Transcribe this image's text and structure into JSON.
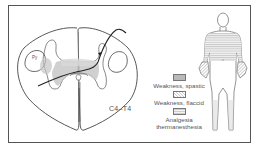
{
  "figure": {
    "segment_label": "C4–T4",
    "tract_label": "Py",
    "legend": [
      {
        "key": "spastic",
        "label": "Weakness, spastic",
        "pattern": "solid-gray"
      },
      {
        "key": "flaccid",
        "label": "Weakness, flaccid",
        "pattern": "diagonal-hatch"
      },
      {
        "key": "analgesia",
        "label_line1": "Analgesia",
        "label_line2": "thermanesthesia",
        "pattern": "horizontal-lines"
      }
    ],
    "colors": {
      "outline": "#555555",
      "spastic_fill": "#b9b9b9",
      "flaccid_fill": "#c8c8c8",
      "analgesia_fill": "#d6d6d6",
      "background": "#ffffff"
    }
  }
}
